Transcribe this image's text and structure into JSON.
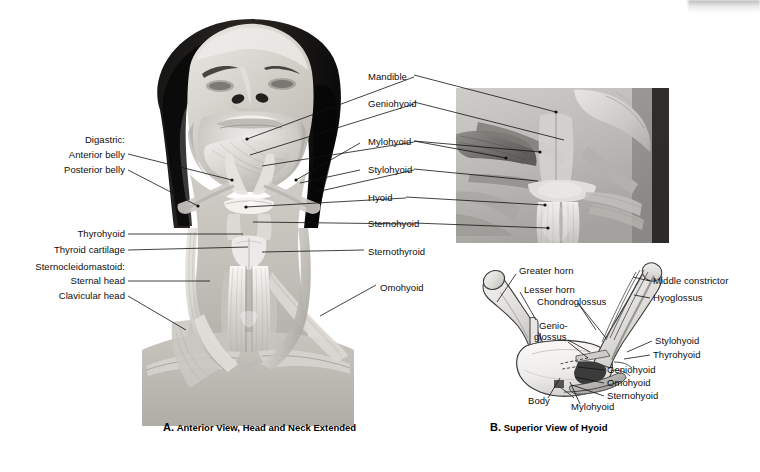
{
  "figure": {
    "width": 760,
    "height": 472,
    "background": "#ffffff",
    "label_color": "#0d0d0d",
    "leader_color": "#111111"
  },
  "panel_a": {
    "caption_letter": "A.",
    "caption_text": "Anterior View, Head and Neck Extended",
    "labels_left": [
      {
        "id": "digastric-group",
        "text": "Digastric:"
      },
      {
        "id": "anterior-belly",
        "text": "Anterior belly"
      },
      {
        "id": "posterior-belly",
        "text": "Posterior belly"
      },
      {
        "id": "thyrohyoid",
        "text": "Thyrohyoid"
      },
      {
        "id": "thyroid-cartilage",
        "text": "Thyroid cartilage"
      },
      {
        "id": "sternocleidomastoid",
        "text": "Sternocleidomastoid:"
      },
      {
        "id": "sternal-head",
        "text": "Sternal head"
      },
      {
        "id": "clavicular-head",
        "text": "Clavicular head"
      }
    ],
    "labels_right": [
      {
        "id": "mandible",
        "text": "Mandible"
      },
      {
        "id": "geniohyoid",
        "text": "Geniohyoid"
      },
      {
        "id": "mylohyoid",
        "text": "Mylohyoid"
      },
      {
        "id": "stylohyoid",
        "text": "Stylohyoid"
      },
      {
        "id": "hyoid",
        "text": "Hyoid"
      },
      {
        "id": "sternohyoid",
        "text": "Sternohyoid"
      },
      {
        "id": "sternothyroid",
        "text": "Sternothyroid"
      },
      {
        "id": "omohyoid",
        "text": "Omohyoid"
      }
    ]
  },
  "panel_b": {
    "caption_letter": "B.",
    "caption_text": "Superior View of Hyoid",
    "labels": [
      {
        "id": "greater-horn",
        "text": "Greater horn"
      },
      {
        "id": "lesser-horn",
        "text": "Lesser horn"
      },
      {
        "id": "chondroglossus",
        "text": "Chondroglossus"
      },
      {
        "id": "genioglossus-line1",
        "text": "Genio-"
      },
      {
        "id": "genioglossus-line2",
        "text": "glossus"
      },
      {
        "id": "body",
        "text": "Body"
      },
      {
        "id": "mylohyoid",
        "text": "Mylohyoid"
      },
      {
        "id": "middle-constrictor",
        "text": "Middle constrictor"
      },
      {
        "id": "hyoglossus",
        "text": "Hyoglossus"
      },
      {
        "id": "stylohyoid",
        "text": "Stylohyoid"
      },
      {
        "id": "thyrohyoid",
        "text": "Thyrohyoid"
      },
      {
        "id": "geniohyoid",
        "text": "Geniohyoid"
      },
      {
        "id": "omohyoid",
        "text": "Omohyoid"
      },
      {
        "id": "sternohyoid",
        "text": "Sternohyoid"
      }
    ]
  }
}
